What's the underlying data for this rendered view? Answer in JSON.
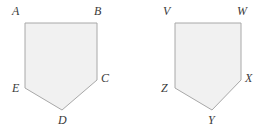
{
  "figure": {
    "caption": "Two congruent pentagons",
    "background_color": "#ffffff",
    "fill_color": "#f1f1f1",
    "stroke_color": "#a8a8a8",
    "label_color": "#3a3a3a",
    "stroke_width": 1,
    "shapes": [
      {
        "name": "pentagon-abcde",
        "points": "25,23 97,23 97,80 62,110 25,88",
        "vertices": [
          {
            "id": "A",
            "label": "A",
            "x": 25,
            "y": 23,
            "label_x": 12,
            "label_y": 5
          },
          {
            "id": "B",
            "label": "B",
            "x": 97,
            "y": 23,
            "label_x": 94,
            "label_y": 5
          },
          {
            "id": "C",
            "label": "C",
            "x": 97,
            "y": 80,
            "label_x": 101,
            "label_y": 72
          },
          {
            "id": "D",
            "label": "D",
            "x": 62,
            "y": 110,
            "label_x": 58,
            "label_y": 114
          },
          {
            "id": "E",
            "label": "E",
            "x": 25,
            "y": 88,
            "label_x": 12,
            "label_y": 82
          }
        ]
      },
      {
        "name": "pentagon-vwxyz",
        "points": "175,23 241,23 241,80 212,110 175,88",
        "vertices": [
          {
            "id": "V",
            "label": "V",
            "x": 175,
            "y": 23,
            "label_x": 163,
            "label_y": 5
          },
          {
            "id": "W",
            "label": "W",
            "x": 241,
            "y": 23,
            "label_x": 237,
            "label_y": 5
          },
          {
            "id": "X",
            "label": "X",
            "x": 241,
            "y": 80,
            "label_x": 245,
            "label_y": 72
          },
          {
            "id": "Y",
            "label": "Y",
            "x": 212,
            "y": 110,
            "label_x": 208,
            "label_y": 114
          },
          {
            "id": "Z",
            "label": "Z",
            "x": 175,
            "y": 88,
            "label_x": 161,
            "label_y": 82
          }
        ]
      }
    ]
  }
}
